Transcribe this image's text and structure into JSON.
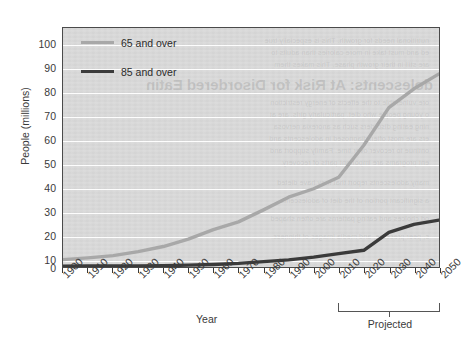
{
  "chart_data": {
    "type": "line",
    "title": "",
    "xlabel": "Year",
    "ylabel": "People (millions)",
    "xlim": [
      1900,
      2050
    ],
    "ylim": [
      0,
      100
    ],
    "grid": true,
    "legend_position": "top-left",
    "x": [
      1900,
      1910,
      1920,
      1930,
      1940,
      1950,
      1960,
      1970,
      1980,
      1990,
      2000,
      2010,
      2020,
      2030,
      2040,
      2050
    ],
    "xtick_labels": [
      "1900",
      "1910",
      "1920",
      "1930",
      "1940",
      "1950",
      "1960",
      "1970",
      "1980",
      "1990",
      "2000",
      "2010",
      "2020",
      "2030",
      "2040",
      "2050"
    ],
    "ytick_labels": [
      "0",
      "10",
      "20",
      "30",
      "40",
      "50",
      "60",
      "70",
      "80",
      "90",
      "100"
    ],
    "yticks": [
      0,
      10,
      20,
      30,
      40,
      50,
      60,
      70,
      80,
      90,
      100
    ],
    "series": [
      {
        "name": "65 and over",
        "color": "#a8a8a8",
        "values": [
          3.1,
          3.9,
          4.9,
          6.7,
          9.0,
          12.3,
          16.6,
          20.1,
          25.5,
          31.2,
          35.0,
          40.2,
          54.6,
          71.5,
          80.0,
          86.7
        ]
      },
      {
        "name": "85 and over",
        "color": "#3b3b3b",
        "values": [
          0.1,
          0.2,
          0.2,
          0.3,
          0.4,
          0.6,
          0.9,
          1.4,
          2.2,
          3.0,
          4.2,
          5.8,
          7.3,
          15.4,
          19.0,
          20.9
        ]
      }
    ],
    "annotations": [
      {
        "text": "Projected",
        "span_start": 2010,
        "span_end": 2050,
        "type": "bracket"
      }
    ]
  },
  "legend": {
    "items": [
      {
        "label": "65 and over",
        "color": "#a8a8a8"
      },
      {
        "label": "85 and over",
        "color": "#3b3b3b"
      }
    ]
  },
  "axes": {
    "y_title": "People (millions)",
    "x_title": "Year"
  },
  "projected": {
    "label": "Projected"
  },
  "background_showthrough": {
    "heading": "dolescents: At Risk for Disordered Eatin",
    "lines": [
      "nutritional needs for growth. This is especially true",
      "ed and must take in more calories than adults to",
      "are still in their growth phase. This makes them",
      "ore vulnerable to the effects of energy restriction",
      "o young people who diet, particularly girls, are at",
      "ning eating disorders such as anorexia nervosa",
      "ers are most often diagnosed in adolescents and",
      "ontinue to recover over time. Family support and",
      "ent programs are important parts of recovery.",
      "many adolescents report that they have dieted",
      "a significant portion of the diet of adolescents",
      "od choices and eating patterns are often shaped",
      "s, peer pressure, and media images of thinness."
    ]
  },
  "colors": {
    "plot_background": "#d9d9d9",
    "gridline": "#fdfdfd",
    "axis": "#4a4a4a",
    "text": "#3a3a3a",
    "series_65": "#a8a8a8",
    "series_85": "#3b3b3b"
  }
}
